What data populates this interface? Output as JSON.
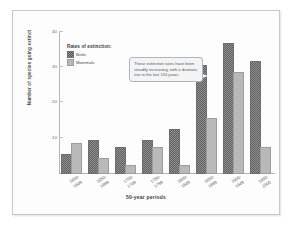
{
  "chart_data": {
    "type": "bar",
    "title": "",
    "xlabel": "50-year periods",
    "ylabel": "Number of species going extinct",
    "ylim": [
      0,
      40
    ],
    "yticks": [
      40,
      30,
      20,
      10
    ],
    "grid": false,
    "legend_position": "top-left",
    "legend_title": "Rates of extinction:",
    "categories": [
      "1600-1649",
      "1650-1699",
      "1700-1749",
      "1750-1799",
      "1800-1849",
      "1850-1899",
      "1900-1949",
      "1950-2000"
    ],
    "series": [
      {
        "name": "Birds",
        "values": [
          5,
          9,
          7,
          9,
          12,
          30,
          36,
          31
        ]
      },
      {
        "name": "Mammals",
        "values": [
          8,
          4,
          2,
          7,
          2,
          15,
          28,
          7
        ]
      }
    ],
    "annotations": [
      {
        "name": "trend-callout",
        "text": "These extinction rates have been steadily increasing, with a dramatic rise in the last 150 years."
      }
    ]
  },
  "axis": {
    "x_title": "50-year periods",
    "y_title": "Number of species going extinct",
    "y_tick_labels": [
      "40",
      "30",
      "20",
      "10"
    ],
    "x_tick_labels": [
      {
        "top": "1600-",
        "bottom": "1649"
      },
      {
        "top": "1650-",
        "bottom": "1699"
      },
      {
        "top": "1700-",
        "bottom": "1749"
      },
      {
        "top": "1750-",
        "bottom": "1799"
      },
      {
        "top": "1800-",
        "bottom": "1849"
      },
      {
        "top": "1850-",
        "bottom": "1899"
      },
      {
        "top": "1900-",
        "bottom": "1949"
      },
      {
        "top": "1950-",
        "bottom": "2000"
      }
    ]
  },
  "legend": {
    "title": "Rates of extinction:",
    "items": [
      {
        "label": "Birds"
      },
      {
        "label": "Mammals"
      }
    ]
  },
  "callout": {
    "text": "These extinction rates have been steadily increasing, with a dramatic rise in the last 150 years."
  },
  "colors": {
    "birds": "#8f8f8f",
    "mammals": "#b9b9b9",
    "axis": "#b5b5b5",
    "callout_border": "#a9b6c4",
    "frame": "#c9c9c9"
  }
}
